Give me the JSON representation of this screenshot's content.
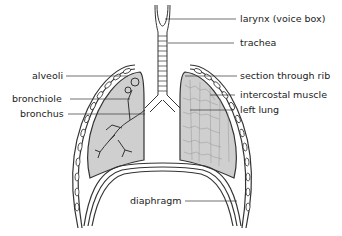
{
  "diagram": {
    "labels": {
      "larynx": "larynx (voice box)",
      "trachea": "trachea",
      "alveoli": "alveoli",
      "rib": "section through rib",
      "bronchiole": "bronchiole",
      "intercostal": "intercostal muscle",
      "bronchus": "bronchus",
      "left_lung": "left lung",
      "diaphragm": "diaphragm"
    },
    "colors": {
      "lung_fill": "#cfcfcf",
      "outline": "#333333",
      "background": "#ffffff"
    }
  }
}
